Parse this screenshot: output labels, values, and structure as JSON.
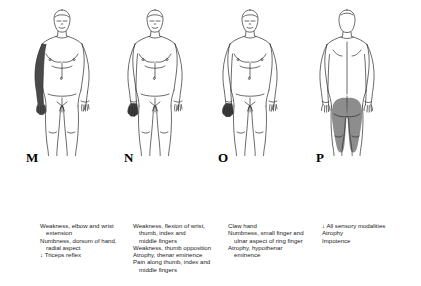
{
  "figure": {
    "panels": [
      {
        "letter": "M",
        "view": "anterior",
        "shaded_region": "right-arm-forearm-and-hand",
        "caption_lines": [
          {
            "text": "Weakness, elbow and wrist",
            "indent": false
          },
          {
            "text": "extension",
            "indent": true
          },
          {
            "text": "Numbness, dorsum of hand,",
            "indent": false
          },
          {
            "text": "radial aspect",
            "indent": true
          },
          {
            "text": "↓ Triceps reflex",
            "indent": false
          }
        ]
      },
      {
        "letter": "N",
        "view": "anterior",
        "shaded_region": "right-hand",
        "caption_lines": [
          {
            "text": "Weakness, flexion of wrist,",
            "indent": false
          },
          {
            "text": "thumb, index and",
            "indent": true
          },
          {
            "text": "middle fingers",
            "indent": true
          },
          {
            "text": "Weakness, thumb opposition",
            "indent": false
          },
          {
            "text": "Atrophy, thenar eminence",
            "indent": false
          },
          {
            "text": "Pain along thumb, index and",
            "indent": false
          },
          {
            "text": "middle fingers",
            "indent": true
          }
        ]
      },
      {
        "letter": "O",
        "view": "anterior",
        "shaded_region": "right-hand",
        "caption_lines": [
          {
            "text": "Claw hand",
            "indent": false
          },
          {
            "text": "Numbness, small finger and",
            "indent": false
          },
          {
            "text": "ulnar aspect of ring finger",
            "indent": true
          },
          {
            "text": "Atrophy, hypothenar",
            "indent": false
          },
          {
            "text": "eminence",
            "indent": true
          }
        ]
      },
      {
        "letter": "P",
        "view": "posterior",
        "shaded_region": "buttocks-and-posterior-thighs",
        "caption_lines": [
          {
            "text": "↓ All sensory modalities",
            "indent": false
          },
          {
            "text": "Atrophy",
            "indent": false
          },
          {
            "text": "Impotence",
            "indent": false
          }
        ]
      }
    ]
  },
  "colors": {
    "background": "#ffffff",
    "outline": "#2b2b2b",
    "dark_shading": "#4a4a4a",
    "gray_shading": "#8d8d8d",
    "text": "#1c1c1c"
  }
}
